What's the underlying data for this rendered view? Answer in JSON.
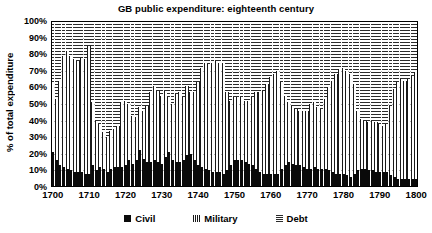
{
  "chart_data": {
    "type": "bar",
    "stacked": true,
    "title": "GB public expenditure: eighteenth century",
    "xlabel": "",
    "ylabel": "% of total expenditure",
    "ylim": [
      0,
      100
    ],
    "ytick_labels": [
      "0%",
      "10%",
      "20%",
      "30%",
      "40%",
      "50%",
      "60%",
      "70%",
      "80%",
      "90%",
      "100%"
    ],
    "ytick_values": [
      0,
      10,
      20,
      30,
      40,
      50,
      60,
      70,
      80,
      90,
      100
    ],
    "xtick_labels": [
      "1700",
      "1710",
      "1720",
      "1730",
      "1740",
      "1750",
      "1760",
      "1770",
      "1780",
      "1790",
      "1800"
    ],
    "xtick_values": [
      1700,
      1710,
      1720,
      1730,
      1740,
      1750,
      1760,
      1770,
      1780,
      1790,
      1800
    ],
    "grid": true,
    "legend_position": "bottom",
    "categories": [
      1700,
      1701,
      1702,
      1703,
      1704,
      1705,
      1706,
      1707,
      1708,
      1709,
      1710,
      1711,
      1712,
      1713,
      1714,
      1715,
      1716,
      1717,
      1718,
      1719,
      1720,
      1721,
      1722,
      1723,
      1724,
      1725,
      1726,
      1727,
      1728,
      1729,
      1730,
      1731,
      1732,
      1733,
      1734,
      1735,
      1736,
      1737,
      1738,
      1739,
      1740,
      1741,
      1742,
      1743,
      1744,
      1745,
      1746,
      1747,
      1748,
      1749,
      1750,
      1751,
      1752,
      1753,
      1754,
      1755,
      1756,
      1757,
      1758,
      1759,
      1760,
      1761,
      1762,
      1763,
      1764,
      1765,
      1766,
      1767,
      1768,
      1769,
      1770,
      1771,
      1772,
      1773,
      1774,
      1775,
      1776,
      1777,
      1778,
      1779,
      1780,
      1781,
      1782,
      1783,
      1784,
      1785,
      1786,
      1787,
      1788,
      1789,
      1790,
      1791,
      1792,
      1793,
      1794,
      1795,
      1796,
      1797,
      1798,
      1799,
      1800
    ],
    "series": [
      {
        "name": "Civil",
        "key_symbol": "filled-square",
        "color": "#0a0a0a",
        "pattern": "solid",
        "values": [
          21,
          16,
          13,
          12,
          11,
          10,
          9,
          9,
          9,
          8,
          8,
          13,
          10,
          12,
          11,
          9,
          11,
          12,
          12,
          12,
          13,
          16,
          14,
          16,
          22,
          17,
          15,
          15,
          16,
          15,
          14,
          18,
          21,
          16,
          15,
          15,
          16,
          19,
          20,
          16,
          13,
          12,
          11,
          10,
          9,
          9,
          9,
          8,
          10,
          13,
          16,
          16,
          16,
          15,
          14,
          13,
          11,
          9,
          8,
          8,
          8,
          8,
          8,
          11,
          13,
          15,
          14,
          13,
          13,
          12,
          11,
          11,
          12,
          11,
          11,
          11,
          10,
          9,
          8,
          8,
          8,
          7,
          6,
          8,
          10,
          11,
          11,
          10,
          10,
          9,
          9,
          9,
          9,
          7,
          6,
          5,
          5,
          5,
          5,
          5,
          5
        ]
      },
      {
        "name": "Military",
        "key_symbol": "narrow-bar",
        "color": "#1a1a1a",
        "pattern": "vertical-hatch",
        "values": [
          42,
          37,
          51,
          67,
          71,
          69,
          68,
          67,
          69,
          69,
          77,
          38,
          30,
          26,
          22,
          21,
          23,
          23,
          25,
          39,
          39,
          34,
          29,
          26,
          26,
          29,
          34,
          42,
          45,
          43,
          41,
          40,
          33,
          34,
          41,
          42,
          38,
          42,
          37,
          41,
          50,
          60,
          64,
          64,
          66,
          67,
          66,
          67,
          47,
          39,
          38,
          38,
          38,
          37,
          38,
          41,
          46,
          48,
          50,
          54,
          58,
          60,
          62,
          52,
          42,
          36,
          35,
          34,
          33,
          34,
          35,
          39,
          39,
          37,
          36,
          42,
          50,
          55,
          60,
          63,
          64,
          63,
          62,
          54,
          36,
          30,
          29,
          29,
          30,
          30,
          29,
          28,
          29,
          42,
          53,
          58,
          60,
          59,
          60,
          62,
          64
        ]
      },
      {
        "name": "Debt",
        "key_symbol": "dash",
        "color": "#2b2b2b",
        "pattern": "horizontal-hatch",
        "values": [
          37,
          47,
          36,
          21,
          18,
          21,
          23,
          24,
          22,
          23,
          15,
          49,
          60,
          62,
          67,
          70,
          66,
          65,
          63,
          49,
          48,
          50,
          57,
          58,
          52,
          54,
          51,
          43,
          39,
          42,
          45,
          42,
          46,
          50,
          44,
          43,
          46,
          39,
          43,
          43,
          37,
          28,
          25,
          26,
          25,
          24,
          25,
          25,
          43,
          48,
          46,
          46,
          46,
          48,
          48,
          46,
          43,
          43,
          42,
          38,
          34,
          32,
          30,
          37,
          45,
          49,
          51,
          53,
          54,
          54,
          54,
          50,
          49,
          52,
          53,
          47,
          40,
          36,
          32,
          29,
          28,
          30,
          32,
          38,
          54,
          59,
          60,
          61,
          60,
          61,
          62,
          63,
          62,
          51,
          41,
          37,
          35,
          36,
          35,
          33,
          31
        ]
      }
    ]
  },
  "legend": {
    "items": [
      {
        "label": "Civil"
      },
      {
        "label": "Military"
      },
      {
        "label": "Debt"
      }
    ]
  }
}
